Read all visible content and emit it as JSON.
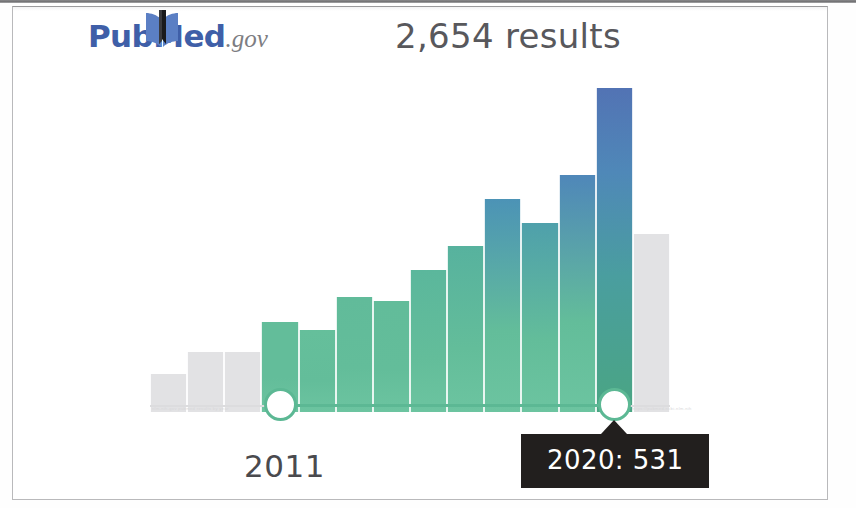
{
  "header": {
    "logo": {
      "pub": "Pub",
      "med": "Med",
      "gov": ".gov",
      "icon": "book-icon",
      "color_text": "#3f5fa8",
      "color_gov": "#7d7d82"
    },
    "results_count": "2,654 results"
  },
  "slider": {
    "start_label": "2011",
    "end_label": "2020",
    "tooltip": "2020: 531",
    "handle_color": "#5cb894",
    "track_color": "#5cb894",
    "tooltip_bg": "#221f1e",
    "tooltip_text_color": "#ffffff"
  },
  "watermark": {
    "left": "nlm.nih.gov pubmed results by year",
    "right": "https://pubmed.ncbi.nlm.nih"
  },
  "chart_data": {
    "type": "bar",
    "title": "2,654 results",
    "xlabel": "",
    "ylabel": "",
    "ylim": [
      0,
      560
    ],
    "grid": false,
    "legend": null,
    "selected_range": [
      "2011",
      "2020"
    ],
    "selected_point": {
      "category": "2020",
      "value": 531
    },
    "colors": {
      "active_green": "#6cc4a0",
      "active_blue": "#5273b4",
      "inactive_gray": "#e2e2e4"
    },
    "categories": [
      "2008",
      "2009",
      "2010",
      "2011",
      "2012",
      "2013",
      "2014",
      "2015",
      "2016",
      "2017",
      "2018",
      "2019",
      "2020",
      "2021"
    ],
    "values": [
      62,
      98,
      98,
      148,
      134,
      188,
      182,
      232,
      272,
      348,
      310,
      388,
      531,
      292
    ],
    "bars": [
      {
        "category": "2008",
        "value": 62,
        "state": "inactive",
        "top_color": "#e2e2e4"
      },
      {
        "category": "2009",
        "value": 98,
        "state": "inactive",
        "top_color": "#e2e2e4"
      },
      {
        "category": "2010",
        "value": 98,
        "state": "inactive",
        "top_color": "#e2e2e4"
      },
      {
        "category": "2011",
        "value": 148,
        "state": "active",
        "top_color": "#63bd9a"
      },
      {
        "category": "2012",
        "value": 134,
        "state": "active",
        "top_color": "#65bf9b"
      },
      {
        "category": "2013",
        "value": 188,
        "state": "active",
        "top_color": "#61bb9a"
      },
      {
        "category": "2014",
        "value": 182,
        "state": "active",
        "top_color": "#62bc9a"
      },
      {
        "category": "2015",
        "value": 232,
        "state": "active",
        "top_color": "#5bb79c"
      },
      {
        "category": "2016",
        "value": 272,
        "state": "active",
        "top_color": "#57b29e"
      },
      {
        "category": "2017",
        "value": 348,
        "state": "active",
        "top_color": "#4c93b6"
      },
      {
        "category": "2018",
        "value": 310,
        "state": "active",
        "top_color": "#4fa0ab"
      },
      {
        "category": "2019",
        "value": 388,
        "state": "active",
        "top_color": "#4f87b9"
      },
      {
        "category": "2020",
        "value": 531,
        "state": "active",
        "top_color": "#5273b4"
      },
      {
        "category": "2021",
        "value": 292,
        "state": "inactive",
        "top_color": "#e2e2e4"
      }
    ]
  }
}
